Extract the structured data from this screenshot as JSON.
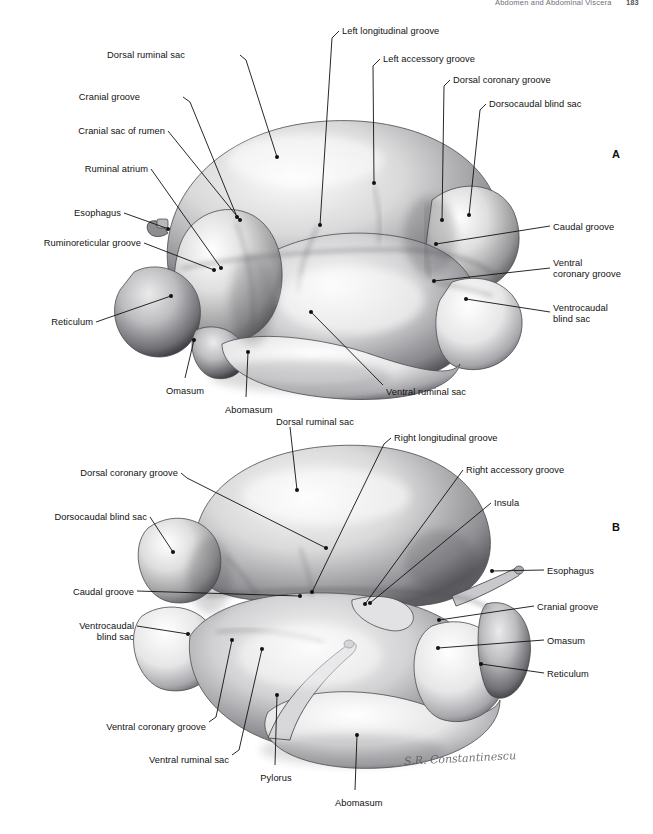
{
  "page": {
    "running_head": "Abdomen and Abdominal Viscera",
    "folio": "183",
    "background": "#ffffff",
    "ink": "#111111"
  },
  "figure": {
    "signature": "S.R. Constantinescu",
    "panels": [
      {
        "id": "A",
        "letter": "A",
        "letter_x": 612,
        "letter_y": 148
      },
      {
        "id": "B",
        "letter": "B",
        "letter_x": 612,
        "letter_y": 521
      }
    ]
  },
  "labels_a": [
    {
      "text": "Dorsal ruminal sac",
      "x": 185,
      "y": 50,
      "align": "right",
      "leader": "M 240 55 L 246 60 M 246 60 L 277 157",
      "dot": [
        277,
        157
      ]
    },
    {
      "text": "Cranial groove",
      "x": 140,
      "y": 92,
      "align": "right",
      "leader": "M 183 97 L 190 102 M 190 102 L 237 217",
      "dot": [
        237,
        217
      ]
    },
    {
      "text": "Cranial sac of rumen",
      "x": 165,
      "y": 126,
      "align": "right",
      "leader": "M 168 131 L 240 220",
      "dot": [
        240,
        220
      ]
    },
    {
      "text": "Ruminal atrium",
      "x": 148,
      "y": 164,
      "align": "right",
      "leader": "M 151 169 L 221 268",
      "dot": [
        221,
        268
      ]
    },
    {
      "text": "Esophagus",
      "x": 121,
      "y": 208,
      "align": "right",
      "leader": "M 124 213 L 166 228",
      "dot": [
        168,
        229
      ]
    },
    {
      "text": "Ruminoreticular groove",
      "x": 141,
      "y": 238,
      "align": "right",
      "leader": "M 144 243 L 214 270",
      "dot": [
        214,
        270
      ]
    },
    {
      "text": "Reticulum",
      "x": 93,
      "y": 317,
      "align": "right",
      "leader": "M 96 322 L 171 296",
      "dot": [
        171,
        296
      ]
    },
    {
      "text": "Omasum",
      "x": 165,
      "y": 386,
      "align": "center",
      "leader": "M 185 378 L 194 340",
      "dot": [
        194,
        340
      ]
    },
    {
      "text": "Abomasum",
      "x": 225,
      "y": 405,
      "align": "center",
      "leader": "M 246 397 L 248 352",
      "dot": [
        248,
        352
      ]
    },
    {
      "text": "Ventral ruminal sac",
      "x": 386,
      "y": 387,
      "align": "left",
      "leader": "M 383 385 L 311 312",
      "dot": [
        311,
        312
      ]
    },
    {
      "text": "Left longitudinal groove",
      "x": 342,
      "y": 26,
      "align": "left",
      "leader": "M 339 31 L 332 38 M 332 38 L 320 225",
      "dot": [
        320,
        225
      ]
    },
    {
      "text": "Left accessory groove",
      "x": 383,
      "y": 54,
      "align": "left",
      "leader": "M 380 59 L 373 66 M 373 66 L 374 183",
      "dot": [
        374,
        183
      ]
    },
    {
      "text": "Dorsal coronary groove",
      "x": 453,
      "y": 75,
      "align": "left",
      "leader": "M 450 80 L 444 86 M 444 86 L 442 220",
      "dot": [
        442,
        220
      ]
    },
    {
      "text": "Dorsocaudal blind sac",
      "x": 489,
      "y": 99,
      "align": "left",
      "leader": "M 486 104 L 480 110 M 480 110 L 469 215",
      "dot": [
        469,
        215
      ]
    },
    {
      "text": "Caudal groove",
      "x": 553,
      "y": 222,
      "align": "left",
      "leader": "M 550 226 L 436 244",
      "dot": [
        436,
        244
      ]
    },
    {
      "text": "Ventral\ncoronary groove",
      "x": 553,
      "y": 258,
      "align": "left",
      "leader": "M 550 268 L 434 281",
      "dot": [
        434,
        281
      ]
    },
    {
      "text": "Ventrocaudal\nblind sac",
      "x": 553,
      "y": 303,
      "align": "left",
      "leader": "M 550 312 L 466 299",
      "dot": [
        466,
        299
      ]
    }
  ],
  "labels_b": [
    {
      "text": "Dorsal ruminal sac",
      "x": 276,
      "y": 417,
      "align": "left",
      "leader": "M 290 427 L 297 490",
      "dot": [
        297,
        490
      ]
    },
    {
      "text": "Right longitudinal groove",
      "x": 394,
      "y": 433,
      "align": "left",
      "leader": "M 391 438 L 384 444 M 384 444 L 312 592",
      "dot": [
        312,
        592
      ]
    },
    {
      "text": "Right accessory groove",
      "x": 466,
      "y": 465,
      "align": "left",
      "leader": "M 463 470 L 365 604",
      "dot": [
        365,
        604
      ]
    },
    {
      "text": "Insula",
      "x": 494,
      "y": 498,
      "align": "left",
      "leader": "M 491 503 L 370 603",
      "dot": [
        370,
        603
      ]
    },
    {
      "text": "Dorsal coronary groove",
      "x": 178,
      "y": 468,
      "align": "right",
      "leader": "M 181 473 L 187 478 M 187 478 L 326 548",
      "dot": [
        326,
        548
      ]
    },
    {
      "text": "Dorsocaudal blind sac",
      "x": 147,
      "y": 512,
      "align": "right",
      "leader": "M 150 517 L 173 552",
      "dot": [
        173,
        552
      ]
    },
    {
      "text": "Caudal groove",
      "x": 134,
      "y": 587,
      "align": "right",
      "leader": "M 137 591 L 300 596",
      "dot": [
        300,
        596
      ]
    },
    {
      "text": "Ventrocaudal\nblind sac",
      "x": 134,
      "y": 621,
      "align": "right",
      "leader": "M 137 626 L 188 634",
      "dot": [
        188,
        634
      ]
    },
    {
      "text": "Ventral coronary groove",
      "x": 206,
      "y": 722,
      "align": "right",
      "leader": "M 209 722 L 216 717 M 216 717 L 232 640",
      "dot": [
        232,
        640
      ]
    },
    {
      "text": "Ventral ruminal sac",
      "x": 229,
      "y": 755,
      "align": "right",
      "leader": "M 232 755 L 239 750 M 239 750 L 262 649",
      "dot": [
        262,
        649
      ]
    },
    {
      "text": "Pylorus",
      "x": 256,
      "y": 773,
      "align": "center",
      "leader": "M 275 765 L 277 695",
      "dot": [
        277,
        695
      ]
    },
    {
      "text": "Abomasum",
      "x": 335,
      "y": 798,
      "align": "center",
      "leader": "M 355 790 L 357 735",
      "dot": [
        357,
        735
      ]
    },
    {
      "text": "Esophagus",
      "x": 547,
      "y": 566,
      "align": "left",
      "leader": "M 544 570 L 492 571",
      "dot": [
        492,
        571
      ]
    },
    {
      "text": "Cranial groove",
      "x": 537,
      "y": 602,
      "align": "left",
      "leader": "M 534 606 L 439 620",
      "dot": [
        439,
        620
      ]
    },
    {
      "text": "Omasum",
      "x": 547,
      "y": 636,
      "align": "left",
      "leader": "M 544 640 L 438 648",
      "dot": [
        438,
        648
      ]
    },
    {
      "text": "Reticulum",
      "x": 547,
      "y": 669,
      "align": "left",
      "leader": "M 544 673 L 481 664",
      "dot": [
        481,
        664
      ]
    }
  ]
}
